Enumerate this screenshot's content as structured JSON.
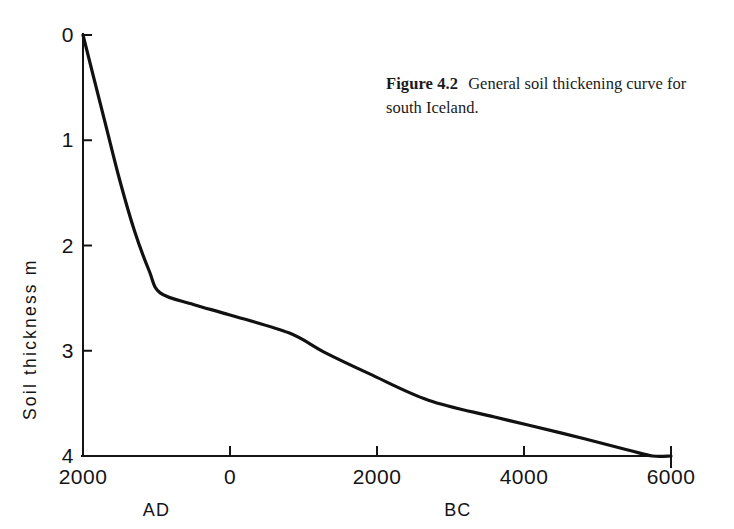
{
  "caption": {
    "label": "Figure 4.2",
    "text": "General soil thickening curve for south Iceland."
  },
  "chart_data": {
    "type": "line",
    "title": "",
    "subtitle": "",
    "xlabel": "",
    "ylabel": "Soil thickness  m",
    "x_tick_labels": [
      "2000",
      "0",
      "2000",
      "4000",
      "6000"
    ],
    "x_tick_values": [
      -2000,
      0,
      2000,
      4000,
      6000
    ],
    "x_era_labels": [
      {
        "label": "AD",
        "at_value": -1000
      },
      {
        "label": "BC",
        "at_value": 3100
      }
    ],
    "y_tick_labels": [
      "0",
      "1",
      "2",
      "3",
      "4"
    ],
    "y_tick_values": [
      0,
      1,
      2,
      3,
      4
    ],
    "xlim": [
      -2000,
      6000
    ],
    "ylim": [
      0,
      4
    ],
    "y_inverted": true,
    "grid": false,
    "legend": false,
    "line_color": "#111111",
    "series": [
      {
        "name": "General soil thickening curve",
        "x": [
          -2000,
          -1700,
          -1500,
          -1300,
          -1100,
          -950,
          -500,
          0,
          800,
          1300,
          1900,
          2700,
          3600,
          4500,
          5400,
          5750,
          6000
        ],
        "y": [
          0.0,
          0.83,
          1.38,
          1.86,
          2.24,
          2.45,
          2.56,
          2.66,
          2.83,
          3.02,
          3.22,
          3.47,
          3.63,
          3.78,
          3.94,
          4.0,
          4.0
        ]
      }
    ]
  },
  "axis": {
    "y_axis_name": "y-axis",
    "x_axis_name": "x-axis"
  }
}
